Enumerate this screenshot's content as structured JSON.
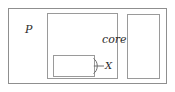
{
  "diagram": {
    "type": "nested-component-boxes",
    "outer": {
      "name": "P",
      "label": "P"
    },
    "children": [
      {
        "name": "core",
        "label": "core",
        "children": [
          {
            "name": "pc",
            "label": "pc",
            "interface": {
              "kind": "required-interface-socket",
              "label": "X"
            }
          }
        ]
      },
      {
        "name": "mmu",
        "label": "mmu"
      }
    ]
  },
  "colors": {
    "outer_border": "#8f8f8f",
    "inner_border": "#9a9a9a",
    "text": "#2b2b2b",
    "background": "#ffffff"
  }
}
